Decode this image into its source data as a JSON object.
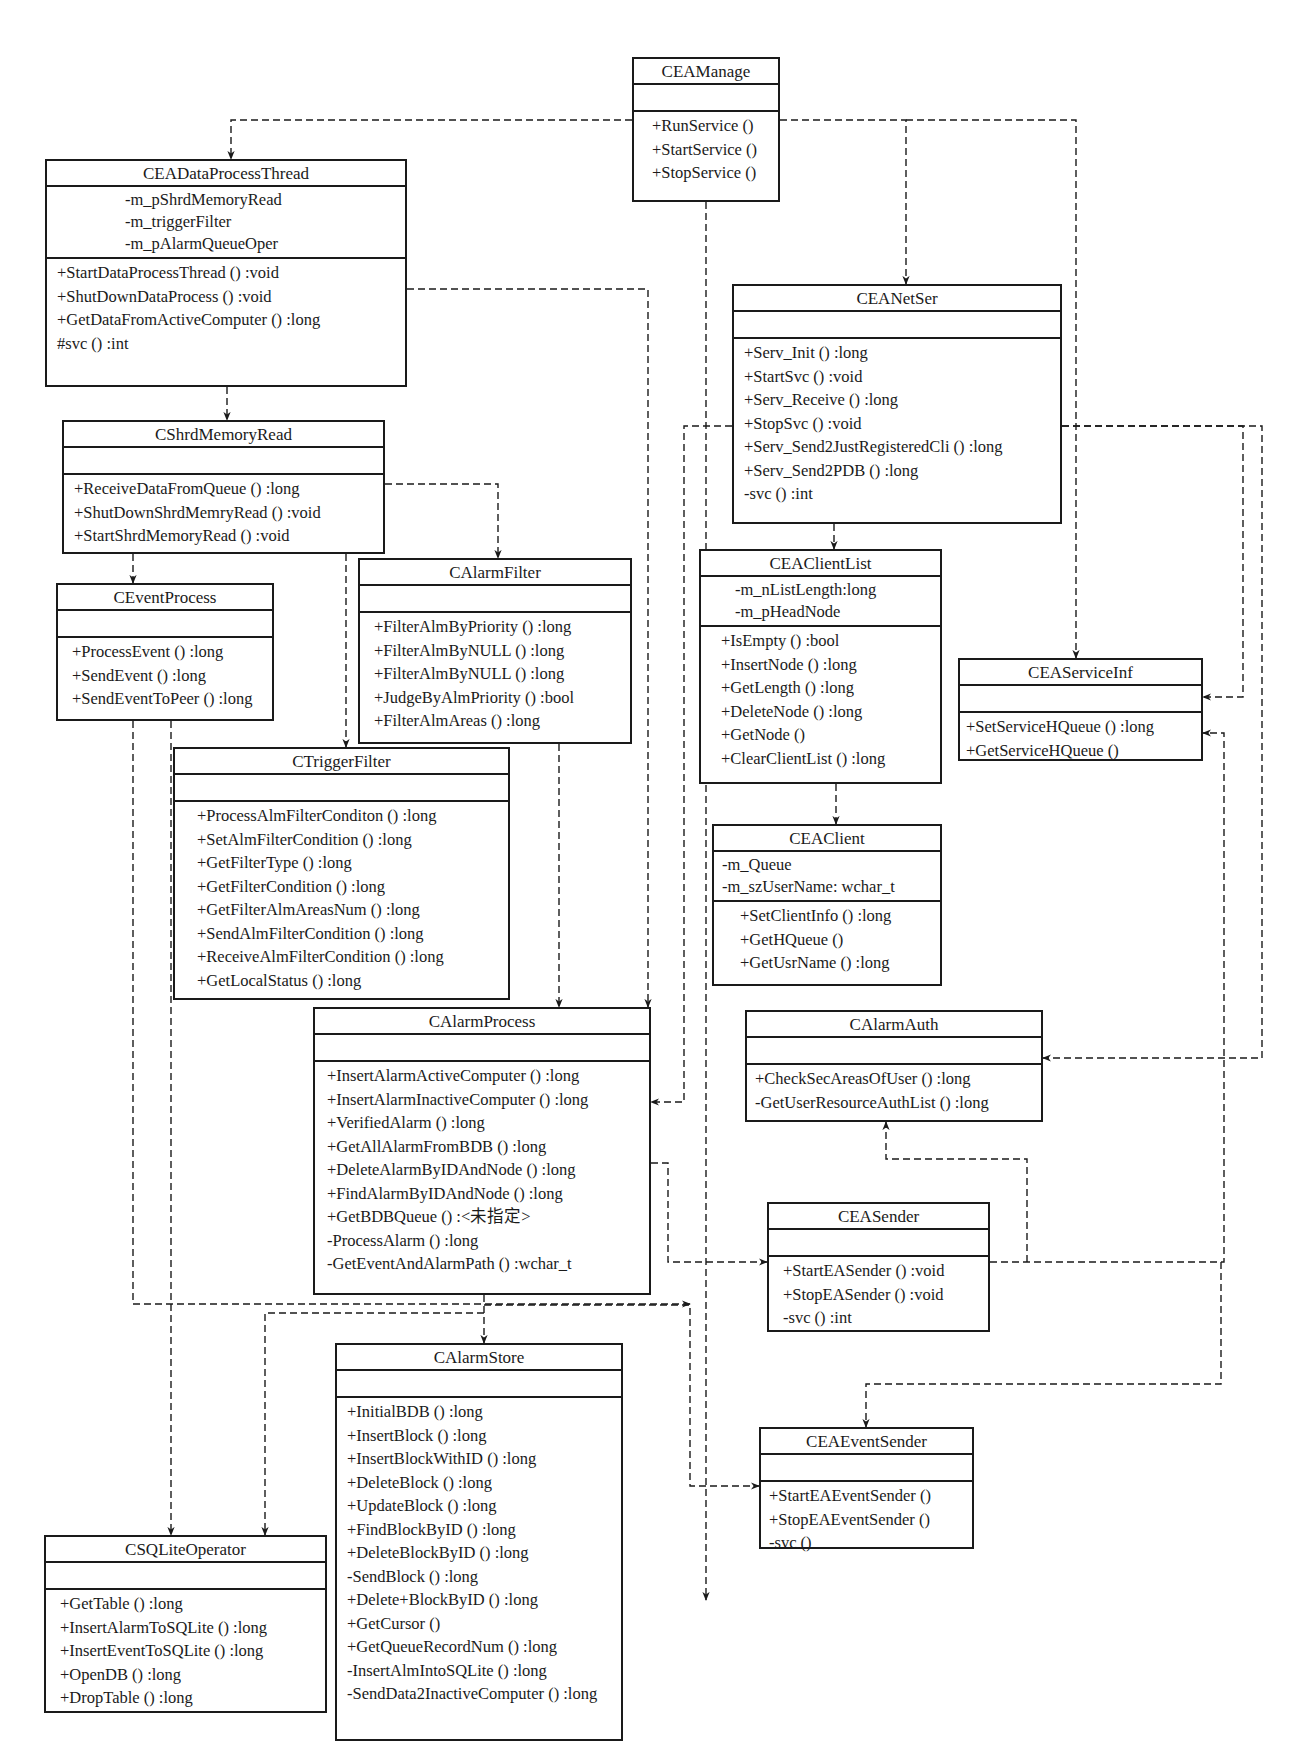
{
  "diagram": {
    "type": "UML class diagram",
    "stroke_color": "#1a1a1a",
    "connector_style": "dashed dependency arrows"
  },
  "classes": {
    "CEAManage": {
      "name": "CEAManage",
      "attributes": [],
      "operations": [
        "+RunService ()",
        "+StartService ()",
        "+StopService ()"
      ]
    },
    "CEADataProcessThread": {
      "name": "CEADataProcessThread",
      "attributes": [
        "-m_pShrdMemoryRead",
        "-m_triggerFilter",
        "-m_pAlarmQueueOper"
      ],
      "operations": [
        "+StartDataProcessThread () :void",
        "+ShutDownDataProcess () :void",
        "+GetDataFromActiveComputer () :long",
        "#svc () :int"
      ]
    },
    "CEANetSer": {
      "name": "CEANetSer",
      "attributes": [],
      "operations": [
        "+Serv_Init () :long",
        "+StartSvc () :void",
        "+Serv_Receive () :long",
        "+StopSvc () :void",
        "+Serv_Send2JustRegisteredCli () :long",
        "+Serv_Send2PDB () :long",
        "-svc () :int"
      ]
    },
    "CShrdMemoryRead": {
      "name": "CShrdMemoryRead",
      "attributes": [],
      "operations": [
        "+ReceiveDataFromQueue () :long",
        "+ShutDownShrdMemryRead () :void",
        "+StartShrdMemoryRead () :void"
      ]
    },
    "CEventProcess": {
      "name": "CEventProcess",
      "attributes": [],
      "operations": [
        "+ProcessEvent () :long",
        "+SendEvent () :long",
        "+SendEventToPeer () :long"
      ]
    },
    "CAlarmFilter": {
      "name": "CAlarmFilter",
      "attributes": [],
      "operations": [
        "+FilterAlmByPriority () :long",
        "+FilterAlmByNULL () :long",
        "+FilterAlmByNULL () :long",
        "+JudgeByAlmPriority () :bool",
        "+FilterAlmAreas () :long"
      ]
    },
    "CEAClientList": {
      "name": "CEAClientList",
      "attributes": [
        "-m_nListLength:long",
        "-m_pHeadNode"
      ],
      "operations": [
        "+IsEmpty () :bool",
        "+InsertNode () :long",
        "+GetLength () :long",
        "+DeleteNode () :long",
        "+GetNode ()",
        "+ClearClientList () :long"
      ]
    },
    "CEAServiceInf": {
      "name": "CEAServiceInf",
      "attributes": [],
      "operations": [
        "+SetServiceHQueue () :long",
        "+GetServiceHQueue ()"
      ]
    },
    "CTriggerFilter": {
      "name": "CTriggerFilter",
      "attributes": [],
      "operations": [
        "+ProcessAlmFilterConditon () :long",
        "+SetAlmFilterCondition () :long",
        "+GetFilterType () :long",
        "+GetFilterCondition () :long",
        "+GetFilterAlmAreasNum () :long",
        "+SendAlmFilterCondition () :long",
        "+ReceiveAlmFilterCondition () :long",
        "+GetLocalStatus () :long"
      ]
    },
    "CEAClient": {
      "name": "CEAClient",
      "attributes": [
        "-m_Queue",
        "-m_szUserName: wchar_t"
      ],
      "operations": [
        "+SetClientInfo () :long",
        "+GetHQueue ()",
        "+GetUsrName () :long"
      ]
    },
    "CAlarmProcess": {
      "name": "CAlarmProcess",
      "attributes": [],
      "operations": [
        "+InsertAlarmActiveComputer () :long",
        "+InsertAlarmInactiveComputer () :long",
        "+VerifiedAlarm () :long",
        "+GetAllAlarmFromBDB () :long",
        "+DeleteAlarmByIDAndNode () :long",
        "+FindAlarmByIDAndNode () :long",
        "+GetBDBQueue () :<未指定>",
        "-ProcessAlarm () :long",
        "-GetEventAndAlarmPath () :wchar_t"
      ]
    },
    "CAlarmAuth": {
      "name": "CAlarmAuth",
      "attributes": [],
      "operations": [
        "+CheckSecAreasOfUser () :long",
        "-GetUserResourceAuthList () :long"
      ]
    },
    "CEASender": {
      "name": "CEASender",
      "attributes": [],
      "operations": [
        "+StartEASender () :void",
        "+StopEASender () :void",
        "-svc () :int"
      ]
    },
    "CAlarmStore": {
      "name": "CAlarmStore",
      "attributes": [],
      "operations": [
        "+InitialBDB () :long",
        "+InsertBlock () :long",
        "+InsertBlockWithID () :long",
        "+DeleteBlock () :long",
        "+UpdateBlock () :long",
        "+FindBlockByID () :long",
        "+DeleteBlockByID () :long",
        "-SendBlock () :long",
        "+Delete+BlockByID () :long",
        "+GetCursor ()",
        "+GetQueueRecordNum () :long",
        "-InsertAlmIntoSQLite () :long",
        "-SendData2InactiveComputer () :long"
      ]
    },
    "CEAEventSender": {
      "name": "CEAEventSender",
      "attributes": [],
      "operations": [
        "+StartEAEventSender ()",
        "+StopEAEventSender ()",
        "-svc ()"
      ]
    },
    "CSQLiteOperator": {
      "name": "CSQLiteOperator",
      "attributes": [],
      "operations": [
        "+GetTable () :long",
        "+InsertAlarmToSQLite () :long",
        "+InsertEventToSQLite () :long",
        "+OpenDB () :long",
        "+DropTable () :long"
      ]
    }
  },
  "layout": [
    {
      "id": "CEAManage",
      "x": 632,
      "y": 57,
      "w": 148,
      "h": 145,
      "pad": 18,
      "attrs_align": "left"
    },
    {
      "id": "CEADataProcessThread",
      "x": 45,
      "y": 159,
      "w": 362,
      "h": 228,
      "pad": 10,
      "attrs_pad": 78
    },
    {
      "id": "CEANetSer",
      "x": 732,
      "y": 284,
      "w": 330,
      "h": 240,
      "pad": 10
    },
    {
      "id": "CShrdMemoryRead",
      "x": 62,
      "y": 420,
      "w": 323,
      "h": 134,
      "pad": 10
    },
    {
      "id": "CEventProcess",
      "x": 56,
      "y": 583,
      "w": 218,
      "h": 138,
      "pad": 14
    },
    {
      "id": "CAlarmFilter",
      "x": 358,
      "y": 558,
      "w": 274,
      "h": 186,
      "pad": 14
    },
    {
      "id": "CEAClientList",
      "x": 699,
      "y": 549,
      "w": 243,
      "h": 235,
      "pad": 20,
      "attrs_pad": 34
    },
    {
      "id": "CEAServiceInf",
      "x": 958,
      "y": 658,
      "w": 245,
      "h": 103,
      "pad": 6
    },
    {
      "id": "CTriggerFilter",
      "x": 173,
      "y": 747,
      "w": 337,
      "h": 253,
      "pad": 22
    },
    {
      "id": "CEAClient",
      "x": 712,
      "y": 824,
      "w": 230,
      "h": 162,
      "pad": 8,
      "ops_pad": 26
    },
    {
      "id": "CAlarmProcess",
      "x": 313,
      "y": 1007,
      "w": 338,
      "h": 288,
      "pad": 12
    },
    {
      "id": "CAlarmAuth",
      "x": 745,
      "y": 1010,
      "w": 298,
      "h": 112,
      "pad": 8
    },
    {
      "id": "CEASender",
      "x": 767,
      "y": 1202,
      "w": 223,
      "h": 130,
      "pad": 14
    },
    {
      "id": "CAlarmStore",
      "x": 335,
      "y": 1343,
      "w": 288,
      "h": 398,
      "pad": 10
    },
    {
      "id": "CEAEventSender",
      "x": 759,
      "y": 1427,
      "w": 215,
      "h": 122,
      "pad": 8
    },
    {
      "id": "CSQLiteOperator",
      "x": 44,
      "y": 1535,
      "w": 283,
      "h": 178,
      "pad": 14
    }
  ],
  "connectors": [
    {
      "from": "CEAManage",
      "to": "CEADataProcessThread",
      "points": [
        [
          632,
          120
        ],
        [
          231,
          120
        ],
        [
          231,
          159
        ]
      ]
    },
    {
      "from": "CEAManage",
      "to": "CEANetSer",
      "points": [
        [
          780,
          120
        ],
        [
          906,
          120
        ],
        [
          906,
          284
        ]
      ]
    },
    {
      "from": "CEAManage",
      "to": "CEAServiceInf",
      "points": [
        [
          906,
          120
        ],
        [
          1076,
          120
        ],
        [
          1076,
          658
        ]
      ]
    },
    {
      "from": "CEAManage",
      "to": "CAlarmProcess",
      "points": [
        [
          706,
          202
        ],
        [
          706,
          1600
        ]
      ]
    },
    {
      "from": "CEADataProcessThread",
      "to": "CShrdMemoryRead",
      "points": [
        [
          227,
          387
        ],
        [
          227,
          420
        ]
      ]
    },
    {
      "from": "CEADataProcessThread",
      "to": "CAlarmProcess",
      "points": [
        [
          407,
          289
        ],
        [
          648,
          289
        ],
        [
          648,
          1007
        ]
      ]
    },
    {
      "from": "CShrdMemoryRead",
      "to": "CEventProcess",
      "points": [
        [
          133,
          554
        ],
        [
          133,
          583
        ]
      ]
    },
    {
      "from": "CShrdMemoryRead",
      "to": "CAlarmFilter",
      "points": [
        [
          385,
          484
        ],
        [
          498,
          484
        ],
        [
          498,
          558
        ]
      ]
    },
    {
      "from": "CShrdMemoryRead",
      "to": "CTriggerFilter",
      "points": [
        [
          346,
          554
        ],
        [
          346,
          747
        ]
      ]
    },
    {
      "from": "CAlarmFilter",
      "to": "CAlarmProcess",
      "points": [
        [
          559,
          744
        ],
        [
          559,
          1007
        ]
      ]
    },
    {
      "from": "CEANetSer",
      "to": "CEAClientList",
      "points": [
        [
          834,
          524
        ],
        [
          834,
          549
        ]
      ]
    },
    {
      "from": "CEANetSer",
      "to": "CAlarmProcess",
      "points": [
        [
          732,
          426
        ],
        [
          684,
          426
        ],
        [
          684,
          1102
        ],
        [
          651,
          1102
        ]
      ]
    },
    {
      "from": "CEANetSer",
      "to": "CEAServiceInf",
      "points": [
        [
          1062,
          426
        ],
        [
          1243,
          426
        ],
        [
          1243,
          697
        ],
        [
          1203,
          697
        ]
      ]
    },
    {
      "from": "CEANetSer",
      "to": "CAlarmAuth",
      "points": [
        [
          1062,
          426
        ],
        [
          1262,
          426
        ],
        [
          1262,
          1058
        ],
        [
          1043,
          1058
        ]
      ]
    },
    {
      "from": "CEAClientList",
      "to": "CEAClient",
      "points": [
        [
          836,
          784
        ],
        [
          836,
          824
        ]
      ]
    },
    {
      "from": "CEASender",
      "to": "CAlarmAuth",
      "points": [
        [
          1027,
          1262
        ],
        [
          1027,
          1159
        ],
        [
          886,
          1159
        ],
        [
          886,
          1122
        ]
      ]
    },
    {
      "from": "CEASender",
      "to": "CEAServiceInf",
      "points": [
        [
          990,
          1262
        ],
        [
          1224,
          1262
        ],
        [
          1224,
          733
        ],
        [
          1203,
          733
        ]
      ]
    },
    {
      "from": "CEASender",
      "to": "CEAEventSender",
      "points": [
        [
          1221,
          1262
        ],
        [
          1221,
          1384
        ],
        [
          866,
          1384
        ],
        [
          866,
          1427
        ]
      ]
    },
    {
      "from": "CAlarmProcess",
      "to": "CEASender",
      "points": [
        [
          651,
          1163
        ],
        [
          668,
          1163
        ],
        [
          668,
          1262
        ],
        [
          767,
          1262
        ]
      ]
    },
    {
      "from": "CAlarmProcess",
      "to": "CAlarmStore",
      "points": [
        [
          484,
          1295
        ],
        [
          484,
          1343
        ]
      ]
    },
    {
      "from": "CAlarmProcess",
      "to": "CSQLiteOperator",
      "points": [
        [
          484,
          1313
        ],
        [
          265,
          1313
        ],
        [
          265,
          1535
        ]
      ]
    },
    {
      "from": "CAlarmProcess",
      "to": "CEAEventSender",
      "points": [
        [
          484,
          1305
        ],
        [
          690,
          1305
        ],
        [
          690,
          1486
        ],
        [
          759,
          1486
        ]
      ]
    },
    {
      "from": "CEventProcess",
      "to": "CSQLiteOperator",
      "points": [
        [
          171,
          721
        ],
        [
          171,
          1535
        ]
      ]
    },
    {
      "from": "CEventProcess",
      "to": "CEAEventSender",
      "points": [
        [
          133,
          721
        ],
        [
          133,
          1304
        ],
        [
          690,
          1304
        ]
      ]
    }
  ]
}
